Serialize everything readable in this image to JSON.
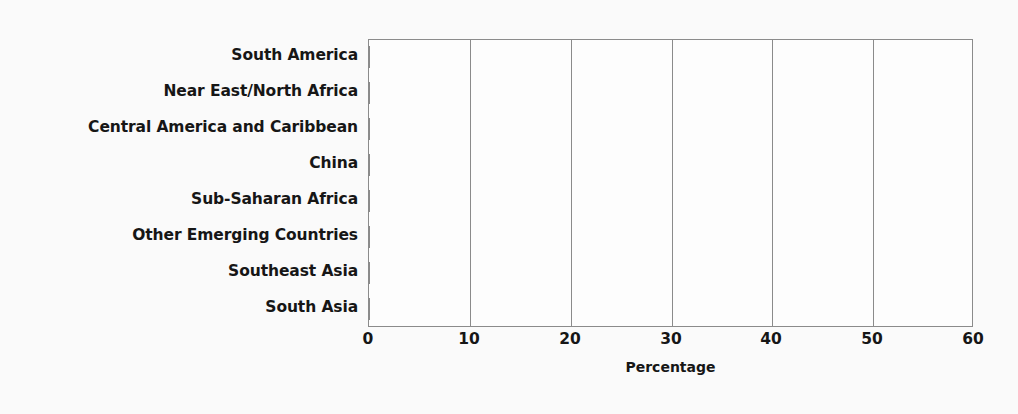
{
  "chart_data": {
    "type": "bar",
    "orientation": "horizontal",
    "title": "",
    "subtitle": "",
    "xlabel": "Percentage",
    "ylabel": "",
    "xlim": [
      0,
      60
    ],
    "xticks": [
      0,
      10,
      20,
      30,
      40,
      50,
      60
    ],
    "xtick_labels": [
      "0",
      "10",
      "20",
      "30",
      "40",
      "50",
      "60"
    ],
    "grid": "vertical",
    "legend": null,
    "categories": [
      "South America",
      "Near East/North Africa",
      "Central America and Caribbean",
      "China",
      "Sub-Saharan Africa",
      "Other Emerging Countries",
      "Southeast Asia",
      "South Asia"
    ],
    "values": [
      8.4,
      13.5,
      15.8,
      21.5,
      31.3,
      34.9,
      38.1,
      57.7
    ],
    "bar_color": "#919191",
    "axis_color": "#8b8b8b",
    "text_color": "#161616",
    "background_color": "#fafafa"
  }
}
